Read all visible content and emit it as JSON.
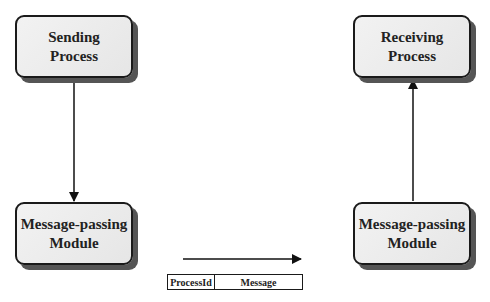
{
  "diagram": {
    "nodes": {
      "sending_process": {
        "line1": "Sending",
        "line2": "Process"
      },
      "receiving_process": {
        "line1": "Receiving",
        "line2": "Process"
      },
      "mpm_left": {
        "line1": "Message-passing",
        "line2": "Module"
      },
      "mpm_right": {
        "line1": "Message-passing",
        "line2": "Module"
      }
    },
    "edges": [
      {
        "from": "sending_process",
        "to": "mpm_left",
        "direction": "down"
      },
      {
        "from": "mpm_right",
        "to": "receiving_process",
        "direction": "up"
      },
      {
        "from": "mpm_left",
        "to": "mpm_right",
        "direction": "right",
        "label": "message packet"
      }
    ],
    "packet": {
      "field1": "ProcessId",
      "field2": "Message"
    },
    "colors": {
      "box_fill": "#ececec",
      "box_border": "#1a1a1a",
      "shadow": "#555555",
      "line": "#111111"
    }
  }
}
